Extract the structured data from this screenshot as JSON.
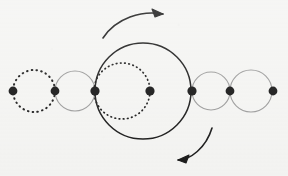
{
  "figure": {
    "width": 288,
    "height": 176,
    "background_color": "#f4f4f2",
    "axis_y": 91
  },
  "palette": {
    "black": "#1a1a1a",
    "gray": "#9a9a9a",
    "dot_fill": "#141414",
    "background": "#f4f4f2"
  },
  "nodes": [
    {
      "id": "p1",
      "label": "1",
      "cx": 13,
      "cy": 91,
      "r": 4.4,
      "color": "#141414"
    },
    {
      "id": "p2",
      "label": "2",
      "cx": 55,
      "cy": 91,
      "r": 4.4,
      "color": "#141414"
    },
    {
      "id": "p3",
      "label": "3",
      "cx": 95,
      "cy": 91,
      "r": 4.6,
      "color": "#141414"
    },
    {
      "id": "p4",
      "label": "4",
      "cx": 150,
      "cy": 91,
      "r": 4.6,
      "color": "#141414"
    },
    {
      "id": "p5",
      "label": "5",
      "cx": 192,
      "cy": 91,
      "r": 4.6,
      "color": "#141414"
    },
    {
      "id": "p6",
      "label": "6",
      "cx": 230,
      "cy": 91,
      "r": 4.4,
      "color": "#141414"
    },
    {
      "id": "p7",
      "label": "7",
      "cx": 273,
      "cy": 91,
      "r": 4.4,
      "color": "#141414"
    }
  ],
  "circles": [
    {
      "id": "c1",
      "name": "small-dotted-circle-left",
      "cx": 34,
      "cy": 91,
      "r": 21,
      "stroke": "#1a1a1a",
      "stroke_width": 2.0,
      "style": "dotted",
      "dash": "0.6 4.2"
    },
    {
      "id": "c2",
      "name": "small-gray-circle-left",
      "cx": 75,
      "cy": 91,
      "r": 20,
      "stroke": "#9a9a9a",
      "stroke_width": 1.1,
      "style": "solid",
      "dash": ""
    },
    {
      "id": "c3",
      "name": "medium-dotted-circle",
      "cx": 122,
      "cy": 91,
      "r": 28,
      "stroke": "#1a1a1a",
      "stroke_width": 1.7,
      "style": "dotted",
      "dash": "0.6 3.6"
    },
    {
      "id": "c4",
      "name": "large-black-circle",
      "cx": 143,
      "cy": 91,
      "r": 48,
      "stroke": "#1a1a1a",
      "stroke_width": 1.5,
      "style": "solid",
      "dash": ""
    },
    {
      "id": "c5",
      "name": "small-gray-circle-right-a",
      "cx": 211,
      "cy": 91,
      "r": 19,
      "stroke": "#9a9a9a",
      "stroke_width": 1.1,
      "style": "solid",
      "dash": ""
    },
    {
      "id": "c6",
      "name": "small-gray-circle-right-b",
      "cx": 251,
      "cy": 91,
      "r": 21,
      "stroke": "#9a9a9a",
      "stroke_width": 1.1,
      "style": "solid",
      "dash": ""
    }
  ],
  "arrows": [
    {
      "id": "a1",
      "name": "top-clockwise-arrow",
      "direction": "right",
      "path": "M 103 38 C 116 18, 142 10, 163 14",
      "head": "M 163 14 L 152 9 L 155 17 Z",
      "stroke": "#1a1a1a",
      "stroke_width": 1.6
    },
    {
      "id": "a2",
      "name": "bottom-clockwise-arrow",
      "direction": "left",
      "path": "M 212 128 C 206 148, 190 160, 178 160",
      "head": "M 178 160 L 189 155 L 186 163 Z",
      "stroke": "#1a1a1a",
      "stroke_width": 1.6
    }
  ],
  "chart_data": {
    "type": "diagram",
    "axis": {
      "y": 91,
      "x_min": 0,
      "x_max": 288
    },
    "dot_x_positions": [
      13,
      55,
      95,
      150,
      192,
      230,
      273
    ],
    "circle_radii": [
      21,
      20,
      28,
      48,
      19,
      21
    ],
    "circle_centers_x": [
      34,
      75,
      122,
      143,
      211,
      251
    ],
    "stroke_styles": [
      "dotted",
      "solid-gray",
      "dotted",
      "solid-black",
      "solid-gray",
      "solid-gray"
    ],
    "legend": [],
    "grid": false
  }
}
